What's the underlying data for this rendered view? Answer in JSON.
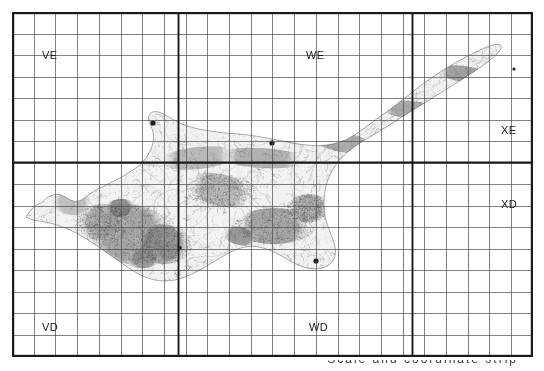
{
  "map": {
    "title": "Cyprus topographic map with MGRS 100 km grid zone overlay",
    "region": "Cyprus",
    "projection_note": "UTM / MGRS grid squares",
    "frame": {
      "x": 12,
      "y": 12,
      "width": 521,
      "height": 345
    },
    "grid": {
      "minor_cell_width": 21.7,
      "minor_cell_height": 21.5,
      "minor_color": "#4a4a4a",
      "minor_width": 0.7,
      "major_color": "#1a1a1a",
      "major_width": 1.9,
      "border_color": "#1a1a1a",
      "border_width": 2.2,
      "columns": 24,
      "rows": 16,
      "major_vertical_x": [
        0,
        166,
        400,
        521
      ],
      "major_horizontal_y": [
        0,
        150,
        345
      ]
    },
    "zone_labels": [
      {
        "id": "zone-ve",
        "text": "VE",
        "x": 30,
        "y": 38
      },
      {
        "id": "zone-we",
        "text": "WE",
        "x": 294,
        "y": 38
      },
      {
        "id": "zone-xe",
        "text": "XE",
        "x": 489,
        "y": 113
      },
      {
        "id": "zone-xd",
        "text": "XD",
        "x": 489,
        "y": 187
      },
      {
        "id": "zone-vd",
        "text": "VD",
        "x": 30,
        "y": 310
      },
      {
        "id": "zone-wd",
        "text": "WD",
        "x": 297,
        "y": 310
      }
    ],
    "settlement_markers": [
      {
        "name": "settlement-morphou",
        "x": 141,
        "y": 111,
        "r": 2.6
      },
      {
        "name": "settlement-nicosia",
        "x": 260,
        "y": 131,
        "r": 2.6
      },
      {
        "name": "settlement-larnaca",
        "x": 304,
        "y": 249,
        "r": 2.6
      },
      {
        "name": "settlement-karpas",
        "x": 502,
        "y": 57,
        "r": 1.6
      },
      {
        "name": "settlement-limassol",
        "x": 168,
        "y": 236,
        "r": 1.8
      }
    ],
    "colors": {
      "paper": "#ffffff",
      "terrain_light": "#e9e9e9",
      "terrain_mid": "#bdbdbd",
      "terrain_dark": "#8d8d8d",
      "contour": "#6b6b6b",
      "grid_minor": "#4a4a4a",
      "grid_major": "#1a1a1a",
      "label_text": "#1b1b1b"
    }
  },
  "caption": {
    "text": "Scale and coordinate strip"
  },
  "terrain": {
    "coast_outline": [
      [
        14,
        205
      ],
      [
        18,
        198
      ],
      [
        24,
        193
      ],
      [
        30,
        191
      ],
      [
        34,
        186
      ],
      [
        40,
        183
      ],
      [
        46,
        182
      ],
      [
        52,
        184
      ],
      [
        58,
        188
      ],
      [
        64,
        190
      ],
      [
        70,
        188
      ],
      [
        76,
        183
      ],
      [
        84,
        178
      ],
      [
        92,
        174
      ],
      [
        100,
        170
      ],
      [
        108,
        166
      ],
      [
        116,
        161
      ],
      [
        124,
        156
      ],
      [
        131,
        150
      ],
      [
        136,
        143
      ],
      [
        140,
        135
      ],
      [
        142,
        127
      ],
      [
        141,
        119
      ],
      [
        138,
        112
      ],
      [
        136,
        106
      ],
      [
        138,
        101
      ],
      [
        143,
        99
      ],
      [
        150,
        101
      ],
      [
        157,
        105
      ],
      [
        165,
        110
      ],
      [
        175,
        114
      ],
      [
        186,
        117
      ],
      [
        198,
        119
      ],
      [
        212,
        121
      ],
      [
        228,
        122
      ],
      [
        244,
        124
      ],
      [
        260,
        127
      ],
      [
        276,
        130
      ],
      [
        292,
        133
      ],
      [
        308,
        134
      ],
      [
        322,
        132
      ],
      [
        334,
        128
      ],
      [
        344,
        122
      ],
      [
        354,
        115
      ],
      [
        366,
        106
      ],
      [
        380,
        96
      ],
      [
        394,
        85
      ],
      [
        408,
        74
      ],
      [
        422,
        64
      ],
      [
        436,
        55
      ],
      [
        450,
        47
      ],
      [
        462,
        41
      ],
      [
        472,
        36
      ],
      [
        480,
        33
      ],
      [
        486,
        32
      ],
      [
        490,
        34
      ],
      [
        488,
        39
      ],
      [
        482,
        45
      ],
      [
        472,
        53
      ],
      [
        460,
        61
      ],
      [
        446,
        70
      ],
      [
        430,
        80
      ],
      [
        414,
        90
      ],
      [
        398,
        100
      ],
      [
        382,
        110
      ],
      [
        368,
        119
      ],
      [
        354,
        127
      ],
      [
        342,
        135
      ],
      [
        332,
        143
      ],
      [
        324,
        152
      ],
      [
        318,
        162
      ],
      [
        314,
        173
      ],
      [
        312,
        185
      ],
      [
        312,
        197
      ],
      [
        314,
        209
      ],
      [
        318,
        220
      ],
      [
        322,
        230
      ],
      [
        324,
        240
      ],
      [
        322,
        248
      ],
      [
        316,
        254
      ],
      [
        308,
        257
      ],
      [
        298,
        257
      ],
      [
        288,
        254
      ],
      [
        278,
        249
      ],
      [
        268,
        243
      ],
      [
        258,
        238
      ],
      [
        248,
        235
      ],
      [
        238,
        234
      ],
      [
        228,
        236
      ],
      [
        218,
        240
      ],
      [
        208,
        246
      ],
      [
        198,
        252
      ],
      [
        188,
        258
      ],
      [
        178,
        263
      ],
      [
        168,
        267
      ],
      [
        158,
        269
      ],
      [
        148,
        269
      ],
      [
        138,
        267
      ],
      [
        128,
        263
      ],
      [
        118,
        257
      ],
      [
        108,
        250
      ],
      [
        98,
        243
      ],
      [
        88,
        236
      ],
      [
        78,
        229
      ],
      [
        68,
        223
      ],
      [
        58,
        218
      ],
      [
        48,
        214
      ],
      [
        38,
        211
      ],
      [
        28,
        209
      ],
      [
        20,
        208
      ]
    ],
    "highland_blobs": [
      {
        "cx": 118,
        "cy": 222,
        "rx": 46,
        "ry": 30,
        "tone": "#9a9a9a"
      },
      {
        "cx": 150,
        "cy": 232,
        "rx": 30,
        "ry": 20,
        "tone": "#8a8a8a"
      },
      {
        "cx": 90,
        "cy": 210,
        "rx": 26,
        "ry": 18,
        "tone": "#a8a8a8"
      },
      {
        "cx": 208,
        "cy": 178,
        "rx": 34,
        "ry": 16,
        "tone": "#b4b4b4"
      },
      {
        "cx": 262,
        "cy": 214,
        "rx": 40,
        "ry": 18,
        "tone": "#9e9e9e"
      },
      {
        "cx": 296,
        "cy": 196,
        "rx": 22,
        "ry": 14,
        "tone": "#ababab"
      },
      {
        "cx": 60,
        "cy": 190,
        "rx": 22,
        "ry": 13,
        "tone": "#b8b8b8"
      },
      {
        "cx": 186,
        "cy": 146,
        "rx": 40,
        "ry": 11,
        "tone": "#b0b0b0"
      },
      {
        "cx": 250,
        "cy": 146,
        "rx": 44,
        "ry": 10,
        "tone": "#a6a6a6"
      },
      {
        "cx": 330,
        "cy": 130,
        "rx": 36,
        "ry": 10,
        "tone": "#a0a0a0"
      },
      {
        "cx": 400,
        "cy": 98,
        "rx": 34,
        "ry": 9,
        "tone": "#9c9c9c"
      },
      {
        "cx": 452,
        "cy": 62,
        "rx": 28,
        "ry": 8,
        "tone": "#949494"
      },
      {
        "cx": 108,
        "cy": 196,
        "rx": 16,
        "ry": 9,
        "tone": "#7f7f7f"
      },
      {
        "cx": 132,
        "cy": 246,
        "rx": 18,
        "ry": 10,
        "tone": "#8f8f8f"
      },
      {
        "cx": 228,
        "cy": 224,
        "rx": 18,
        "ry": 9,
        "tone": "#8b8b8b"
      }
    ]
  }
}
